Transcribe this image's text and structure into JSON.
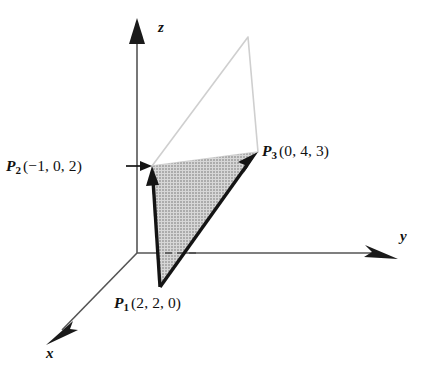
{
  "figure": {
    "type": "3d-vector-diagram",
    "background_color": "#ffffff",
    "ink_color": "#1a1a1a",
    "shade_fill_color": "#b9b9b9",
    "outline_light_color": "#cfcfcf"
  },
  "axes": {
    "z": {
      "label": "z",
      "direction": "up",
      "arrowhead": "solid-triangle"
    },
    "y": {
      "label": "y",
      "direction": "right",
      "arrowhead": "dart"
    },
    "x": {
      "label": "x",
      "direction": "down-left",
      "arrowhead": "dart"
    },
    "origin": {
      "x": 137,
      "y": 253
    }
  },
  "points": [
    {
      "id": "P1",
      "name": "P",
      "subscript": "1",
      "coords_text": "(2, 2, 0)",
      "coords": [
        2,
        2,
        0
      ],
      "px": [
        160,
        287
      ]
    },
    {
      "id": "P2",
      "name": "P",
      "subscript": "2",
      "coords_text": "(−1, 0, 2)",
      "coords": [
        -1,
        0,
        2
      ],
      "px": [
        152,
        166
      ]
    },
    {
      "id": "P3",
      "name": "P",
      "subscript": "3",
      "coords_text": "(0, 4, 3)",
      "coords": [
        0,
        4,
        3
      ],
      "px": [
        258,
        152
      ]
    }
  ],
  "vectors": [
    {
      "id": "v-p1-p2",
      "from": "P1",
      "to": "P2",
      "style": "thick-solid-arrow"
    },
    {
      "id": "v-p1-p3",
      "from": "P1",
      "to": "P3",
      "style": "thick-solid-arrow"
    }
  ],
  "shaded_region": {
    "id": "triangle-p1-p2-p3",
    "vertices": [
      "P1",
      "P2",
      "P3"
    ],
    "fill": "halftone-gray"
  },
  "light_region": {
    "id": "parallelogram-completion",
    "apex_px": [
      248,
      37
    ],
    "vertices": [
      "P2",
      "apex",
      "P3"
    ],
    "stroke": "light-gray"
  },
  "leader": {
    "id": "p2-leader-arrow",
    "points_to": "P2",
    "direction": "right"
  },
  "dashed_segment": {
    "id": "y-axis-hidden-segment",
    "from_px": [
      165,
      253
    ],
    "to_px": [
      201,
      253
    ]
  }
}
